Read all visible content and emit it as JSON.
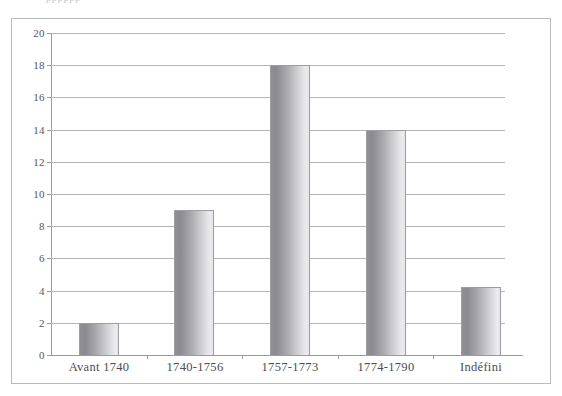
{
  "figure": {
    "clipped_caption_text": "pppppp",
    "frame_color": "#b9b9c0",
    "background": "#ffffff"
  },
  "chart_data": {
    "type": "bar",
    "title": "",
    "subtitle": "",
    "xlabel": "",
    "ylabel": "",
    "categories": [
      "Avant 1740",
      "1740-1756",
      "1757-1773",
      "1774-1790",
      "Indéfini"
    ],
    "values": [
      2,
      9,
      18,
      14,
      4.2
    ],
    "series": [
      {
        "name": "",
        "values": [
          2,
          9,
          18,
          14,
          4.2
        ]
      }
    ],
    "ylim": [
      0,
      20
    ],
    "ytick_labels": [
      "0",
      "2",
      "4",
      "6",
      "8",
      "10",
      "12",
      "14",
      "16",
      "18",
      "20"
    ],
    "ytick_values": [
      0,
      2,
      4,
      6,
      8,
      10,
      12,
      14,
      16,
      18,
      20
    ],
    "grid": true,
    "grid_axis": "y",
    "legend": false,
    "legend_position": "none",
    "bar_fill_start": "#8a8a90",
    "bar_fill_end": "#ececef",
    "bar_border": "#9d9da4",
    "gridline_color": "#b4b4bb",
    "axis_color": "#9a9aa2",
    "text_color": "#4c4c54"
  }
}
